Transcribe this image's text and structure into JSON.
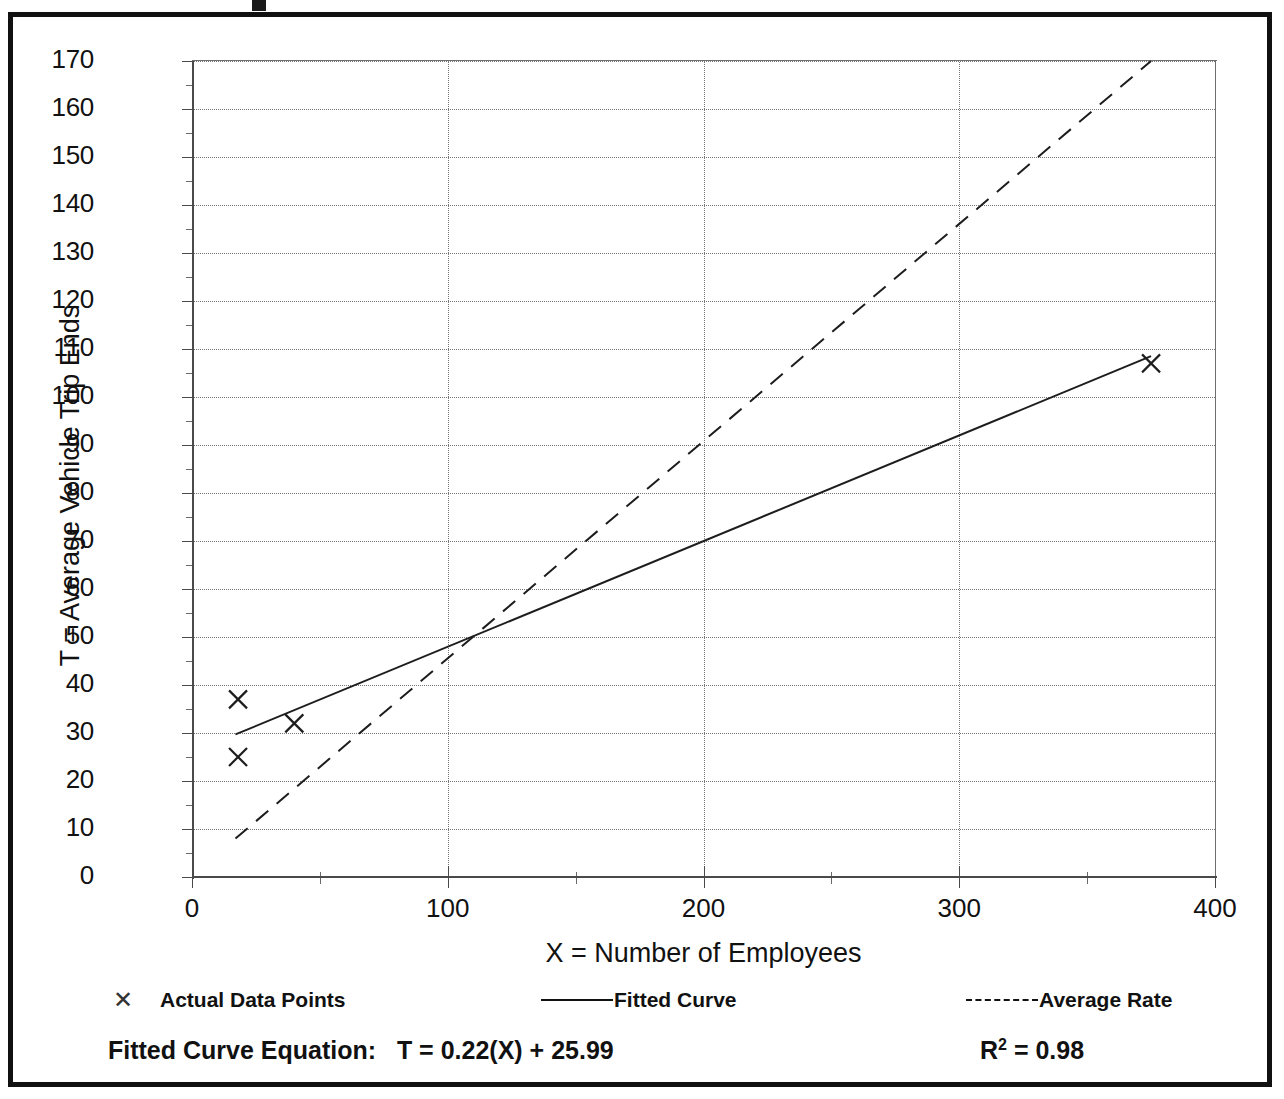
{
  "figure": {
    "frame_color": "#111111",
    "background": "#ffffff"
  },
  "axes": {
    "y_title": "T = Average Vehicle Trip Ends",
    "x_title": "X = Number of Employees"
  },
  "legend": {
    "items": [
      {
        "label": "Actual Data Points",
        "symbol": "x-marker-icon"
      },
      {
        "label": "Fitted Curve",
        "symbol": "solid-line-icon"
      },
      {
        "label": "Average Rate",
        "symbol": "dashed-line-icon"
      }
    ]
  },
  "footer": {
    "equation_label": "Fitted Curve Equation:",
    "equation": "T = 0.22(X) + 25.99",
    "r2_symbol": "R",
    "r2_exponent": "2",
    "r2_value": "= 0.98"
  },
  "chart_data": {
    "type": "scatter",
    "title": "",
    "xlabel": "X = Number of Employees",
    "ylabel": "T = Average Vehicle Trip Ends",
    "xlim": [
      0,
      400
    ],
    "ylim": [
      0,
      170
    ],
    "xticks": [
      0,
      100,
      200,
      300,
      400
    ],
    "xticks_minor": [
      50,
      150,
      250,
      350
    ],
    "yticks": [
      0,
      10,
      20,
      30,
      40,
      50,
      60,
      70,
      80,
      90,
      100,
      110,
      120,
      130,
      140,
      150,
      160,
      170
    ],
    "yticks_minor": [
      5,
      15,
      25,
      35,
      45,
      55,
      65,
      75,
      85,
      95,
      105,
      115,
      125,
      135,
      145,
      155,
      165
    ],
    "grid": true,
    "grid_style": "dotted",
    "legend_position": "below-axes",
    "series": [
      {
        "name": "Actual Data Points",
        "type": "scatter",
        "marker": "x",
        "points": [
          {
            "x": 18,
            "y": 37
          },
          {
            "x": 18,
            "y": 25
          },
          {
            "x": 40,
            "y": 32
          },
          {
            "x": 375,
            "y": 107
          }
        ]
      },
      {
        "name": "Fitted Curve",
        "type": "line",
        "style": "solid",
        "equation": "T = 0.22(X) + 25.99",
        "r_squared": 0.98,
        "points": [
          {
            "x": 17,
            "y": 29.7
          },
          {
            "x": 375,
            "y": 108.5
          }
        ]
      },
      {
        "name": "Average Rate",
        "type": "line",
        "style": "dashed",
        "points": [
          {
            "x": 17,
            "y": 8
          },
          {
            "x": 375,
            "y": 170
          }
        ]
      }
    ]
  }
}
